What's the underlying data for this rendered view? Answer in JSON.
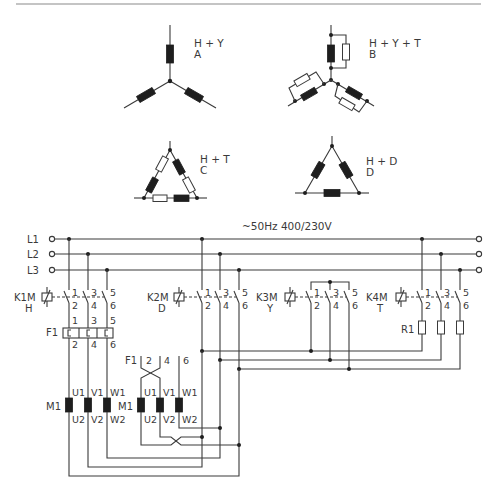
{
  "figure": {
    "type": "electrical-schematic"
  },
  "configurations": [
    {
      "id": "A",
      "title": "H + Y",
      "letter": "A",
      "description": "3 heating elements in star"
    },
    {
      "id": "B",
      "title": "H + Y + T",
      "letter": "B",
      "description": "heating elements in star, each with parallel resistor"
    },
    {
      "id": "C",
      "title": "H + T",
      "letter": "C",
      "description": "triangle with heating + resistor in series per side"
    },
    {
      "id": "D",
      "title": "H + D",
      "letter": "D",
      "description": "3 heating elements in delta"
    }
  ],
  "supply": {
    "label": "~50Hz 400/230V",
    "lines": [
      "L1",
      "L2",
      "L3"
    ]
  },
  "contactors": [
    {
      "id": "K1M",
      "name": "K1M",
      "mode": "H",
      "contacts_top": [
        "1",
        "3",
        "5"
      ],
      "contacts_bottom": [
        "2",
        "4",
        "6"
      ]
    },
    {
      "id": "K2M",
      "name": "K2M",
      "mode": "D",
      "contacts_top": [
        "1",
        "3",
        "5"
      ],
      "contacts_bottom": [
        "2",
        "4",
        "6"
      ]
    },
    {
      "id": "K3M",
      "name": "K3M",
      "mode": "Y",
      "contacts_top": [
        "1",
        "3",
        "5"
      ],
      "contacts_bottom": [
        "2",
        "4",
        "6"
      ]
    },
    {
      "id": "K4M",
      "name": "K4M",
      "mode": "T",
      "contacts_top": [
        "1",
        "3",
        "5"
      ],
      "contacts_bottom": [
        "2",
        "4",
        "6"
      ]
    }
  ],
  "overload": {
    "name": "F1",
    "top": [
      "1",
      "3",
      "5"
    ],
    "bottom": [
      "2",
      "4",
      "6"
    ],
    "ref_label": "F1",
    "ref_terminals": [
      "2",
      "4",
      "6"
    ]
  },
  "resistor": {
    "name": "R1"
  },
  "motors": [
    {
      "name": "M1",
      "top": [
        "U1",
        "V1",
        "W1"
      ],
      "bottom": [
        "U2",
        "V2",
        "W2"
      ]
    },
    {
      "name": "M1",
      "top": [
        "U1",
        "V1",
        "W1"
      ],
      "bottom": [
        "U2",
        "V2",
        "W2"
      ]
    }
  ]
}
